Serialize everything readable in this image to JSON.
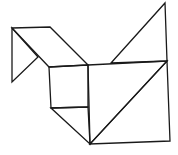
{
  "diagram": {
    "type": "tangram-figure",
    "stroke_color": "#1a1a1a",
    "background": "#ffffff",
    "pieces": [
      {
        "name": "head-triangle",
        "points": "12,28 12,82 38,57"
      },
      {
        "name": "neck-parallelogram",
        "points": "12,28 50,27 88,65 49,67"
      },
      {
        "name": "body-square",
        "points": "49,67 88,65 88,107 51,108"
      },
      {
        "name": "lower-small-triangle",
        "points": "51,108 88,107 90,144"
      },
      {
        "name": "tail-triangle",
        "points": "111,63 165,3 167,61"
      },
      {
        "name": "middle-large-triangle",
        "points": "88,65 167,61 90,144"
      },
      {
        "name": "bottom-large-triangle",
        "points": "167,61 170,141 90,144"
      }
    ]
  }
}
